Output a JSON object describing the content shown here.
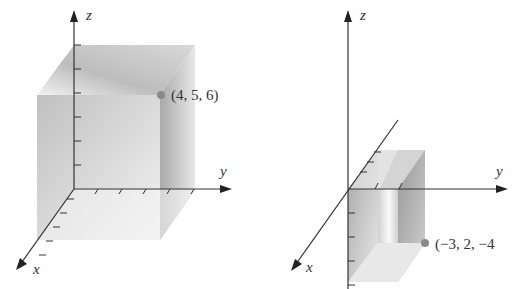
{
  "figures": [
    {
      "name": "left-figure",
      "axes": {
        "x": "x",
        "y": "y",
        "z": "z"
      },
      "point": {
        "label": "(4, 5, 6)",
        "coords": [
          4,
          5,
          6
        ]
      }
    },
    {
      "name": "right-figure",
      "axes": {
        "x": "x",
        "y": "y",
        "z": "z"
      },
      "point": {
        "label": "(−3, 2, −4",
        "coords": [
          -3,
          2,
          -4
        ]
      }
    }
  ],
  "colors": {
    "axis": "#333333",
    "point": "#8a8a8a",
    "box_dark": "#a8a8a8",
    "box_light": "#f2f2f2"
  }
}
